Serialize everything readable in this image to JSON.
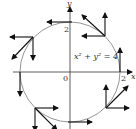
{
  "diagram": {
    "equation": "x² + y² = 4",
    "axis_labels": {
      "x": "x",
      "y": "y"
    },
    "tick_labels": {
      "origin": "0",
      "y_tick": "2",
      "x_tick": "2"
    },
    "circle": {
      "center": [
        0,
        0
      ],
      "radius": 2
    },
    "colors": {
      "curve": "#7a7a7a",
      "axes": "#333333",
      "arrows": "#111111"
    },
    "arrow_groups": [
      {
        "point": "top",
        "vectors": [
          "tangent-left"
        ]
      },
      {
        "point": "upper-right",
        "vectors": [
          "up-left",
          "up",
          "left"
        ]
      },
      {
        "point": "right",
        "vectors": [
          "tangent-up"
        ]
      },
      {
        "point": "lower-right",
        "vectors": [
          "up",
          "up-right",
          "right"
        ]
      },
      {
        "point": "bottom",
        "vectors": [
          "tangent-right"
        ]
      },
      {
        "point": "lower-left",
        "vectors": [
          "right",
          "down",
          "down-right"
        ]
      },
      {
        "point": "left",
        "vectors": [
          "tangent-down"
        ]
      },
      {
        "point": "upper-left",
        "vectors": [
          "left",
          "down",
          "down-left"
        ]
      }
    ]
  }
}
